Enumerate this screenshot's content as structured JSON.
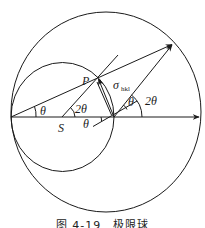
{
  "figure": {
    "caption": "图 4-19　极限球",
    "labels": {
      "point_p": "P",
      "center_s": "S",
      "theta_left": "θ",
      "two_theta_s": "2θ",
      "theta_bottom": "θ",
      "sigma": "σ",
      "sigma_sub": "hkl",
      "theta_right": "θ",
      "two_theta_right": "2θ"
    },
    "elements": {
      "limiting_sphere": "large circle",
      "reflection_sphere": "small circle",
      "incident_axis": "horizontal arrow",
      "reciprocal_vector": "σ_hkl arrow from origin to P",
      "diffracted_vector": "arrow from origin to limiting sphere"
    },
    "colors": {
      "line": "#1a1a1a",
      "background": "#ffffff"
    }
  }
}
